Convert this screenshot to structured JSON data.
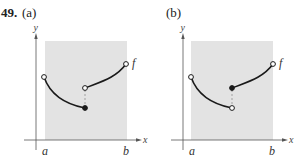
{
  "problem": {
    "number": "49.",
    "parts": [
      {
        "label": "(a)",
        "axes": {
          "x_label": "x",
          "y_label": "y",
          "interval_start": "a",
          "interval_end": "b"
        },
        "function_label": "f",
        "left_piece": {
          "start": "open",
          "end": "closed"
        },
        "right_piece": {
          "start": "open",
          "end": "open"
        },
        "description": "Left piece ends with a filled (closed) dot at the lower point; right piece starts with an open circle at the higher point."
      },
      {
        "label": "(b)",
        "axes": {
          "x_label": "x",
          "y_label": "y",
          "interval_start": "a",
          "interval_end": "b"
        },
        "function_label": "f",
        "left_piece": {
          "start": "open",
          "end": "open"
        },
        "right_piece": {
          "start": "closed",
          "end": "open"
        },
        "description": "Left piece ends with an open circle at the lower point; right piece starts with a filled (closed) dot at the higher point."
      }
    ]
  },
  "colors": {
    "shading": "#e3e3e3",
    "curve": "#1a1a1a",
    "axis": "#555555"
  }
}
